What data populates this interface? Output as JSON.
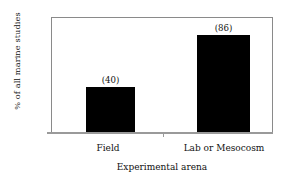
{
  "chart_data": {
    "type": "bar",
    "title": "",
    "categories": [
      "Field",
      "Lab or Mesocosm"
    ],
    "values": [
      32,
      68
    ],
    "point_labels": [
      "(40)",
      "(86)"
    ],
    "counts": [
      40,
      86
    ],
    "xlabel": "Experimental arena",
    "ylabel": "% of all marine studies",
    "ylim": [
      0,
      80
    ],
    "ytick_labels": [
      "0",
      "10",
      "20",
      "30",
      "40",
      "50",
      "60",
      "70",
      "80"
    ],
    "ytick_values": [
      0,
      10,
      20,
      30,
      40,
      50,
      60,
      70,
      80
    ],
    "grid": false,
    "legend": false,
    "bar_color": "#000000",
    "axis_color": "#8a8a8a",
    "background_color": "#ffffff"
  }
}
